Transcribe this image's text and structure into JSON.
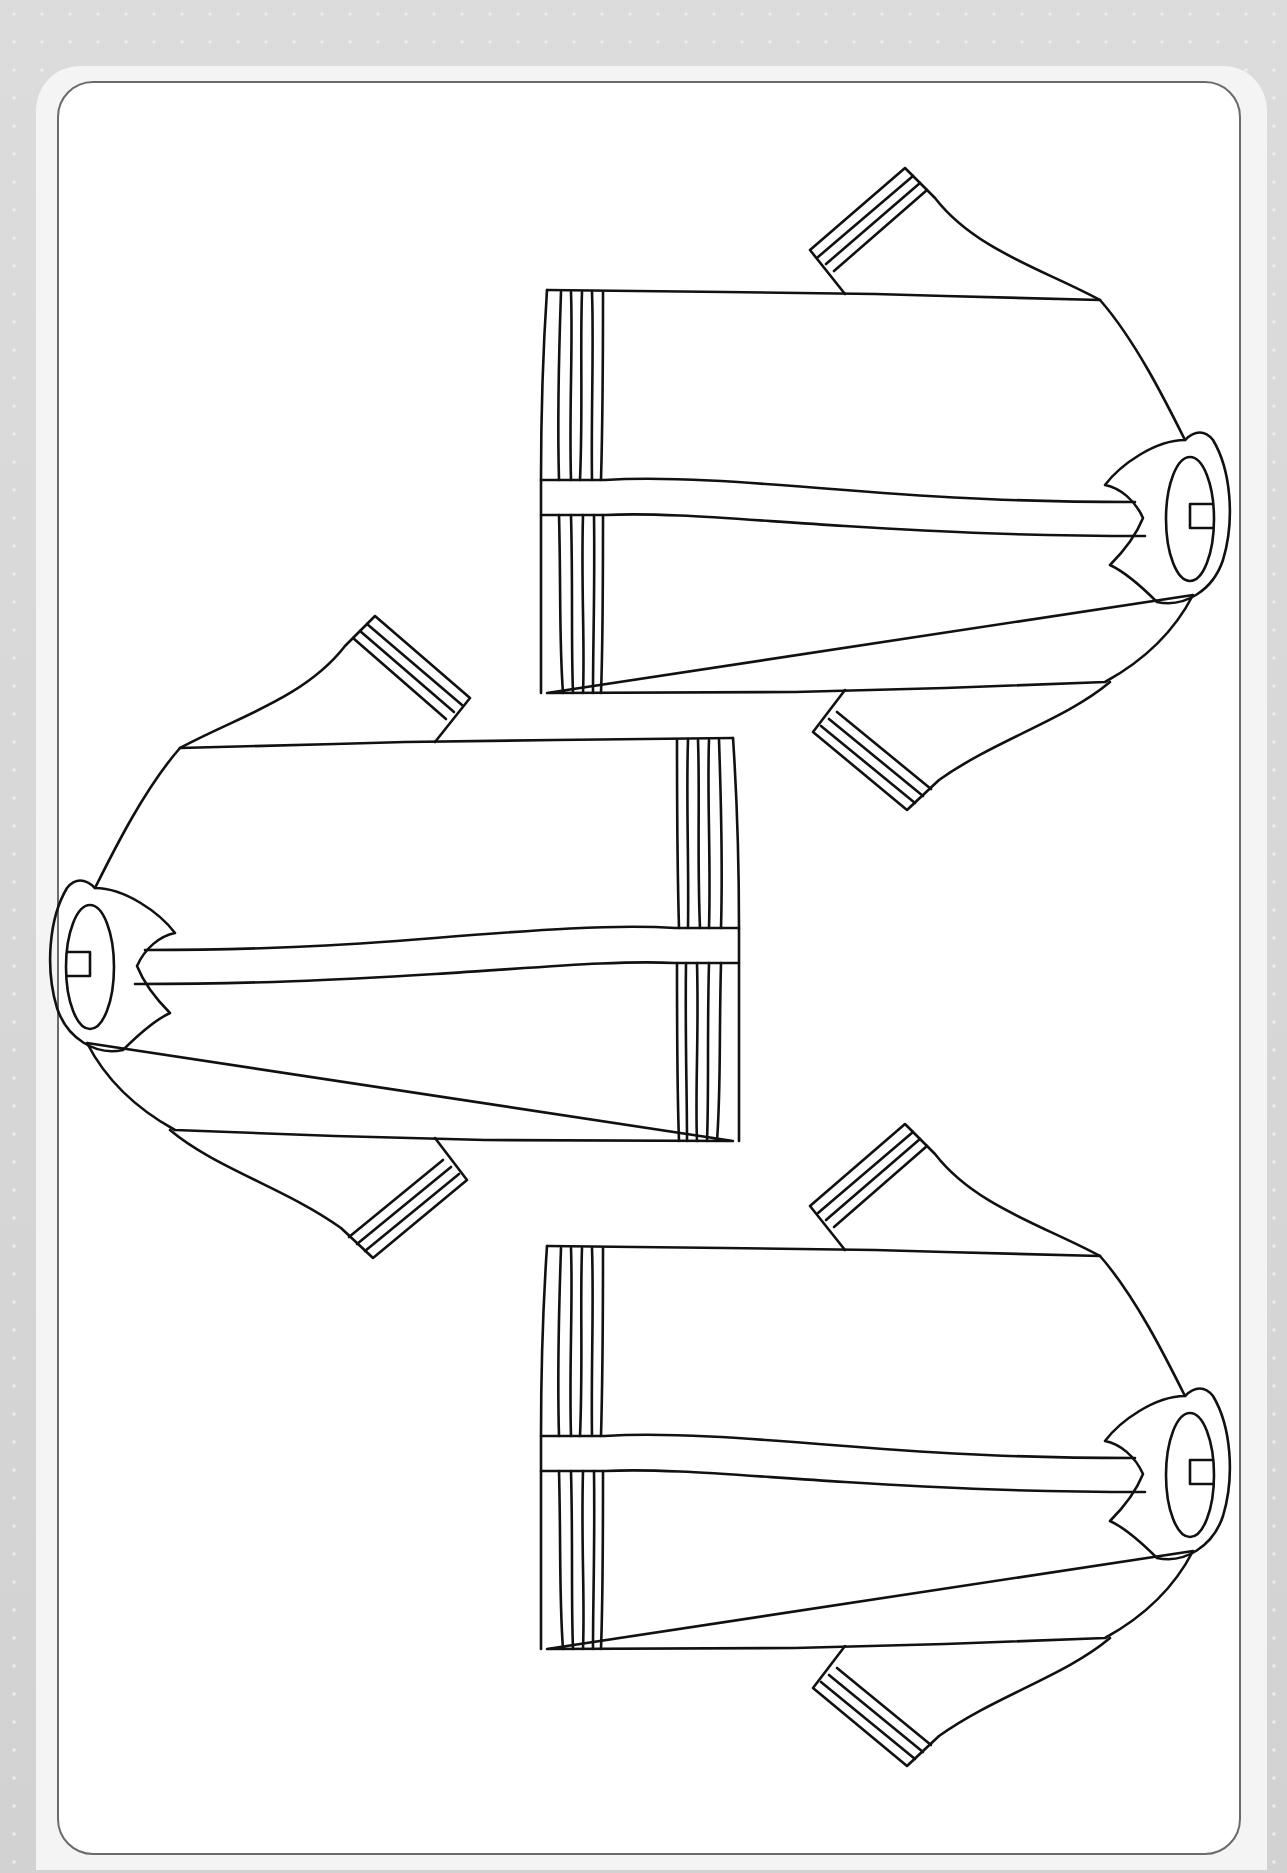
{
  "page": {
    "title": "Coloring page: three striped jackets",
    "background_color": "#d4d4d4",
    "sheet_color": "#ffffff",
    "border_color": "#6b6b6b",
    "line_color": "#111111"
  },
  "illustration": {
    "subject": "jacket-outline",
    "count": 3,
    "items": [
      {
        "name": "jacket-top-right",
        "orientation": "collar-right",
        "x": 545,
        "y": 290
      },
      {
        "name": "jacket-middle-left",
        "orientation": "collar-left",
        "x": 735,
        "y": 735
      },
      {
        "name": "jacket-bottom-right",
        "orientation": "collar-right",
        "x": 545,
        "y": 1243
      }
    ],
    "hem_stripes": 5,
    "cuff_stripes": 4
  }
}
